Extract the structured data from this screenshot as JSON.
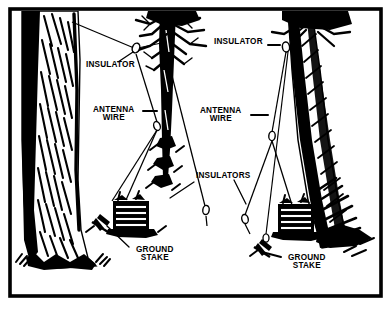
{
  "figure": {
    "type": "line-art-diagram",
    "ink_color": "#000000",
    "paper_color": "#ffffff",
    "border": {
      "style": "solid rectangle",
      "color": "#000000",
      "thickness_px": 4
    }
  },
  "labels": [
    {
      "key": "insulator_left",
      "text": "INSULATOR",
      "x": 86,
      "y": 68,
      "size": 8.2,
      "leader": "diagonal-up-right"
    },
    {
      "key": "insulator_right",
      "text": "INSULATOR",
      "x": 214,
      "y": 45,
      "size": 8.2,
      "leader": "horizontal-dash-right"
    },
    {
      "key": "antenna_wire_left",
      "text": "ANTENNA\nWIRE",
      "x": 93,
      "y": 113,
      "size": 8.2,
      "leader": "horizontal-dash-right"
    },
    {
      "key": "antenna_wire_right",
      "text": "ANTENNA\nWIRE",
      "x": 200,
      "y": 114,
      "size": 8.2,
      "leader": "horizontal-dash-right"
    },
    {
      "key": "insulators_center",
      "text": "INSULATORS",
      "x": 196,
      "y": 178,
      "size": 8.2,
      "leader": "two-diagonal"
    },
    {
      "key": "ground_stake_left",
      "text": "GROUND\nSTAKE",
      "x": 136,
      "y": 253,
      "size": 8.2,
      "leader": "diagonal-up-left"
    },
    {
      "key": "ground_stake_right",
      "text": "GROUND\nSTAKE",
      "x": 288,
      "y": 261,
      "size": 8.2,
      "leader": "horizontal-dash-left"
    }
  ],
  "scene": {
    "trees": [
      {
        "name": "left-tree",
        "trunk_x": 45,
        "style": "heavy-bark-hatching",
        "base_y": 265
      },
      {
        "name": "center-tree",
        "trunk_x": 168,
        "style": "slender-branching",
        "base_y": 200
      },
      {
        "name": "right-tree",
        "trunk_x": 315,
        "style": "diagonal-hatching",
        "base_y": 245
      }
    ],
    "radios": [
      {
        "name": "left-radio-set",
        "x": 127,
        "y": 215
      },
      {
        "name": "right-radio-set",
        "x": 292,
        "y": 218
      }
    ],
    "insulator_nodes": [
      {
        "name": "left-apex-insulator",
        "x": 134,
        "y": 48
      },
      {
        "name": "right-apex-insulator",
        "x": 286,
        "y": 47
      },
      {
        "name": "left-egg-insulator",
        "x": 157,
        "y": 126
      },
      {
        "name": "right-egg-insulator",
        "x": 272,
        "y": 136
      },
      {
        "name": "lower-left-insulator",
        "x": 112,
        "y": 205
      },
      {
        "name": "lower-mid-insulator",
        "x": 207,
        "y": 212
      },
      {
        "name": "lower-right-insulator",
        "x": 245,
        "y": 219
      },
      {
        "name": "lower-far-insulator",
        "x": 266,
        "y": 238
      }
    ],
    "ground_stakes": [
      {
        "name": "left-ground-stake",
        "x": 106,
        "y": 222
      },
      {
        "name": "right-ground-stake",
        "x": 268,
        "y": 246
      }
    ]
  }
}
